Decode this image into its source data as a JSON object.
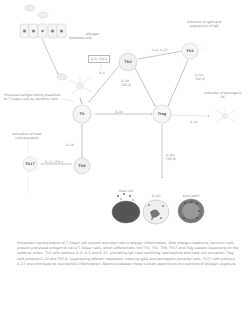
{
  "diagram": {
    "epithelium_label": "Epithelial cells",
    "allergen_label": "Allergen",
    "dc_note": "Processed antigen being presented to T helper cells by dendritic cells",
    "nodes": {
      "th0": "Th",
      "th2": "Th2",
      "th1": "Th1",
      "th9": "Th9",
      "treg": "Treg",
      "th17": "Th17"
    },
    "cytokine_box": "IL-5, IFN-γ",
    "edges": {
      "dc_to_th0": "IL-4",
      "th2_to_th1": "IL-4, IL-13",
      "th2_to_treg": "IL-10, TGF-β",
      "th1_to_treg": "IL-10, TGF-β",
      "th0_to_treg": "IL-10",
      "th0_to_th9": "IL-10",
      "th9_to_th17": "IL-17, IFN-γ",
      "treg_to_mast": "IL-10",
      "treg_down": "IL-10, TGF-β"
    },
    "annotations": {
      "top_right": "Induction of IgG4 and suppression of IgE",
      "right_mid": "Induction of tolerogenic DC",
      "left_mid": "Activation of mast cells/basophils"
    },
    "cells": {
      "mast": "Mast cell",
      "bcell": "B cell",
      "eos": "Eosinophil"
    }
  },
  "caption": "Schematic representation of T helper cell subsets and their role in allergic inflammation. After allergen exposure, dendritic cells present processed antigen to naive T helper cells, which differentiate into Th1, Th2, Th9, Th17 and Treg subsets depending on the cytokine milieu. Th2 cells produce IL-4, IL-5 and IL-13, promoting IgE class switching, eosinophilia and mast cell activation. Treg cells produce IL-10 and TGF-β, suppressing effector responses, inducing IgG4 and tolerogenic dendritic cells. Th17 cells produce IL-17 and contribute to neutrophilic inflammation. Balance between these subsets determines the outcome of allergen exposure."
}
